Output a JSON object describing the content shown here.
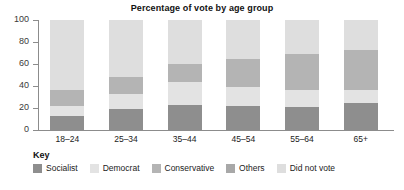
{
  "chart_data": {
    "type": "bar",
    "subtype": "stacked-bar-100",
    "title": "Percentage of vote by age group",
    "xlabel": "",
    "ylabel": "",
    "ylim": [
      0,
      100
    ],
    "yticks": [
      0,
      20,
      40,
      60,
      80,
      100
    ],
    "grid": false,
    "legend_position": "bottom-left",
    "legend_title": "Key",
    "categories": [
      "18–24",
      "25–34",
      "35–44",
      "45–54",
      "55–64",
      "65+"
    ],
    "series": [
      {
        "name": "Socialist",
        "color": "#8e8e8e",
        "values": [
          13,
          19,
          23,
          22,
          21,
          25
        ]
      },
      {
        "name": "Democrat",
        "color": "#e3e3e3",
        "values": [
          9,
          14,
          21,
          17,
          15,
          11
        ]
      },
      {
        "name": "Conservative",
        "color": "#b4b4b4",
        "values": [
          14,
          15,
          16,
          26,
          33,
          37
        ]
      },
      {
        "name": "Others",
        "color": "#a8a8a8",
        "values": [
          0,
          0,
          0,
          0,
          0,
          0
        ]
      },
      {
        "name": "Did not vote",
        "color": "#dedede",
        "values": [
          64,
          52,
          40,
          35,
          31,
          27
        ]
      }
    ]
  },
  "axis": {
    "y_tick_labels": [
      "100",
      "80",
      "60",
      "40",
      "20",
      "0"
    ]
  },
  "legend": {
    "title": "Key",
    "items": [
      {
        "label": "Socialist",
        "color": "#8e8e8e"
      },
      {
        "label": "Democrat",
        "color": "#e3e3e3"
      },
      {
        "label": "Conservative",
        "color": "#b4b4b4"
      },
      {
        "label": "Others",
        "color": "#a8a8a8"
      },
      {
        "label": "Did not vote",
        "color": "#dedede"
      }
    ]
  }
}
